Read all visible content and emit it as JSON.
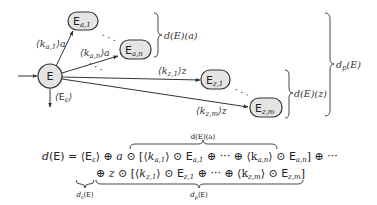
{
  "diagram": {
    "nodes": {
      "root": {
        "label": "E"
      },
      "a1": {
        "label": "E",
        "sub": "a,1"
      },
      "an": {
        "label": "E",
        "sub": "a,n"
      },
      "z1": {
        "label": "E",
        "sub": "z,1"
      },
      "zm": {
        "label": "E",
        "sub": "z,m"
      }
    },
    "edges": {
      "a1": {
        "weight": "⟨k",
        "sub": "a,1",
        "tail": "⟩a"
      },
      "an": {
        "weight": "⟨k",
        "sub": "a,n",
        "tail": "⟩a"
      },
      "z1": {
        "weight": "⟨k",
        "sub": "z,1",
        "tail": "⟩z"
      },
      "zm": {
        "weight": "⟨k",
        "sub": "z,m",
        "tail": "⟩z"
      },
      "eps": {
        "open": "⟨",
        "label": "E",
        "sub": "ε",
        "close": "⟩"
      }
    },
    "ellipses": {
      "a": "· · ·",
      "mid": "· · ·",
      "z": "· · ·"
    },
    "braces": {
      "da": "d(E)(a)",
      "dz": "d(E)(z)",
      "dp_head": "d",
      "dp_sub": "p",
      "dp_tail": "(E)"
    }
  },
  "formula": {
    "line1_lhs": "d(E) = ⟨E",
    "line1_eps": "ε",
    "line1_rest": "⟩ ⊕ a ⊙ [⟨k",
    "t_a1_sub": "a,1",
    "t_a1_mid": "⟩ ⊙ E",
    "t_a1_sub2": "a,1",
    "t_dots": " ⊕ ··· ⊕ ⟨k",
    "t_an_sub": "a,n",
    "t_an_mid": "⟩ ⊙ E",
    "t_an_sub2": "a,n",
    "line1_end": "] ⊕ ···",
    "line2_start": "⊕ z ⊙ [⟨k",
    "t_z1_sub": "z,1",
    "t_z1_mid": "⟩ ⊙ E",
    "t_z1_sub2": "z,1",
    "t_dots2": " ⊕ ··· ⊕ ⟨k",
    "t_zm_sub": "z,m",
    "t_zm_mid": "⟩ ⊙ E",
    "t_zm_sub2": "z,m",
    "line2_end": "]",
    "overbrace_label": "d(E)(a)",
    "underbrace_eps": "d",
    "underbrace_eps_sub": "ε",
    "underbrace_eps_tail": "(E)",
    "underbrace_p": "d",
    "underbrace_p_sub": "p",
    "underbrace_p_tail": "(E)"
  }
}
